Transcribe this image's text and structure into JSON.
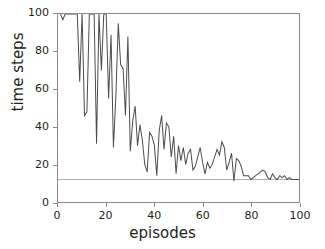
{
  "chart_data": {
    "type": "line",
    "title": "",
    "xlabel": "episodes",
    "ylabel": "time steps",
    "xlim": [
      0,
      100
    ],
    "ylim": [
      0,
      100
    ],
    "xticks": [
      0,
      20,
      40,
      60,
      80,
      100
    ],
    "yticks": [
      0,
      20,
      40,
      60,
      80,
      100
    ],
    "grid": false,
    "legend": null,
    "line_color": "#4d4d4d",
    "reference_line": {
      "name": "solved-threshold",
      "value": 12,
      "color": "#b0b0b0",
      "orientation": "horizontal"
    },
    "clipped_at_top": true,
    "series": [
      {
        "name": "time steps per episode",
        "x": [
          1,
          2,
          3,
          4,
          5,
          6,
          7,
          8,
          9,
          10,
          11,
          12,
          13,
          14,
          15,
          16,
          17,
          18,
          19,
          20,
          21,
          22,
          23,
          24,
          25,
          26,
          27,
          28,
          29,
          30,
          31,
          32,
          33,
          34,
          35,
          36,
          37,
          38,
          39,
          40,
          41,
          42,
          43,
          44,
          45,
          46,
          47,
          48,
          49,
          50,
          51,
          52,
          53,
          54,
          55,
          56,
          57,
          58,
          59,
          60,
          61,
          62,
          63,
          64,
          65,
          66,
          67,
          68,
          69,
          70,
          71,
          72,
          73,
          74,
          75,
          76,
          77,
          78,
          79,
          80,
          81,
          82,
          83,
          84,
          85,
          86,
          87,
          88,
          89,
          90,
          91,
          92,
          93,
          94,
          95,
          96,
          97,
          98,
          99,
          100
        ],
        "values": [
          100,
          97,
          100,
          100,
          100,
          100,
          100,
          100,
          64,
          100,
          46,
          48,
          100,
          100,
          100,
          31,
          100,
          70,
          100,
          100,
          55,
          89,
          29,
          56,
          95,
          73,
          71,
          46,
          88,
          27,
          43,
          51,
          30,
          41,
          33,
          20,
          16,
          37,
          35,
          30,
          14,
          38,
          46,
          28,
          42,
          40,
          24,
          35,
          15,
          30,
          22,
          29,
          20,
          26,
          28,
          17,
          19,
          24,
          29,
          21,
          15,
          21,
          18,
          20,
          24,
          28,
          25,
          32,
          29,
          17,
          21,
          26,
          11,
          23,
          22,
          19,
          14,
          14,
          14,
          12,
          13,
          14,
          15,
          16,
          17,
          16,
          13,
          12,
          15,
          13,
          12,
          14,
          13,
          14,
          12,
          13,
          12,
          12,
          12,
          12
        ]
      }
    ]
  },
  "axes": {
    "xtick_labels": [
      "0",
      "20",
      "40",
      "60",
      "80",
      "100"
    ],
    "ytick_labels": [
      "0",
      "20",
      "40",
      "60",
      "80",
      "100"
    ],
    "xaxis_title": "episodes",
    "yaxis_title": "time steps"
  }
}
